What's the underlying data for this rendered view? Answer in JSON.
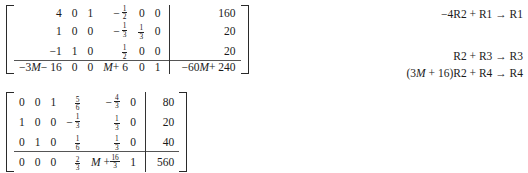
{
  "document": {
    "type": "math-worksheet",
    "colors": {
      "ink": "#1a1a1a",
      "rule": "#555555",
      "background": "#ffffff"
    }
  },
  "matrix_1": {
    "name": "simplex-tableau-before",
    "rows": [
      {
        "coefficients": [
          "4",
          "0",
          "1",
          "-1/2",
          "0",
          "0"
        ],
        "constant": "160"
      },
      {
        "coefficients": [
          "1",
          "0",
          "0",
          "-1/3",
          "1/3",
          "0"
        ],
        "constant": "20"
      },
      {
        "coefficients": [
          "-1",
          "1",
          "0",
          "1/2",
          "0",
          "0"
        ],
        "constant": "20"
      },
      {
        "coefficients": [
          "-3M - 16",
          "0",
          "0",
          "M + 6",
          "0",
          "1"
        ],
        "constant": "-60M + 240",
        "objective": true
      }
    ],
    "cells": [
      [
        {
          "text": "4"
        },
        {
          "text": "0"
        },
        {
          "text": "1"
        },
        {
          "sign": "-",
          "num": "1",
          "den": "2"
        },
        {
          "text": "0"
        },
        {
          "text": "0"
        },
        {
          "text": "160"
        }
      ],
      [
        {
          "text": "1"
        },
        {
          "text": "0"
        },
        {
          "text": "0"
        },
        {
          "sign": "-",
          "num": "1",
          "den": "3"
        },
        {
          "num": "1",
          "den": "3"
        },
        {
          "text": "0"
        },
        {
          "text": "20"
        }
      ],
      [
        {
          "text": "-1"
        },
        {
          "text": "1"
        },
        {
          "text": "0"
        },
        {
          "num": "1",
          "den": "2"
        },
        {
          "text": "0"
        },
        {
          "text": "0"
        },
        {
          "text": "20"
        }
      ],
      [
        {
          "text": "-3M - 16",
          "italic_var": "M"
        },
        {
          "text": "0"
        },
        {
          "text": "0"
        },
        {
          "text": "M + 6",
          "italic_var": "M"
        },
        {
          "text": "0"
        },
        {
          "text": "1"
        },
        {
          "text": "-60M + 240",
          "italic_var": "M"
        }
      ]
    ]
  },
  "matrix_2": {
    "name": "simplex-tableau-after",
    "cells": [
      [
        {
          "text": "0"
        },
        {
          "text": "0"
        },
        {
          "text": "1"
        },
        {
          "num": "5",
          "den": "6"
        },
        {
          "sign": "-",
          "num": "4",
          "den": "3"
        },
        {
          "text": "0"
        },
        {
          "text": "80"
        }
      ],
      [
        {
          "text": "1"
        },
        {
          "text": "0"
        },
        {
          "text": "0"
        },
        {
          "sign": "-",
          "num": "1",
          "den": "3"
        },
        {
          "num": "1",
          "den": "3"
        },
        {
          "text": "0"
        },
        {
          "text": "20"
        }
      ],
      [
        {
          "text": "0"
        },
        {
          "text": "1"
        },
        {
          "text": "0"
        },
        {
          "num": "1",
          "den": "6"
        },
        {
          "num": "1",
          "den": "3"
        },
        {
          "text": "0"
        },
        {
          "text": "40"
        }
      ],
      [
        {
          "text": "0"
        },
        {
          "text": "0"
        },
        {
          "text": "0"
        },
        {
          "num": "2",
          "den": "3"
        },
        {
          "prefix": "M + ",
          "num": "16",
          "den": "3",
          "italic_var": "M"
        },
        {
          "text": "1"
        },
        {
          "text": "560"
        }
      ]
    ]
  },
  "row_operations": {
    "label": "row-operations",
    "lines": [
      "−4R2 + R1 → R1",
      "",
      "R2 + R3 → R3",
      "(3M + 16)R2 + R4 → R4"
    ]
  }
}
